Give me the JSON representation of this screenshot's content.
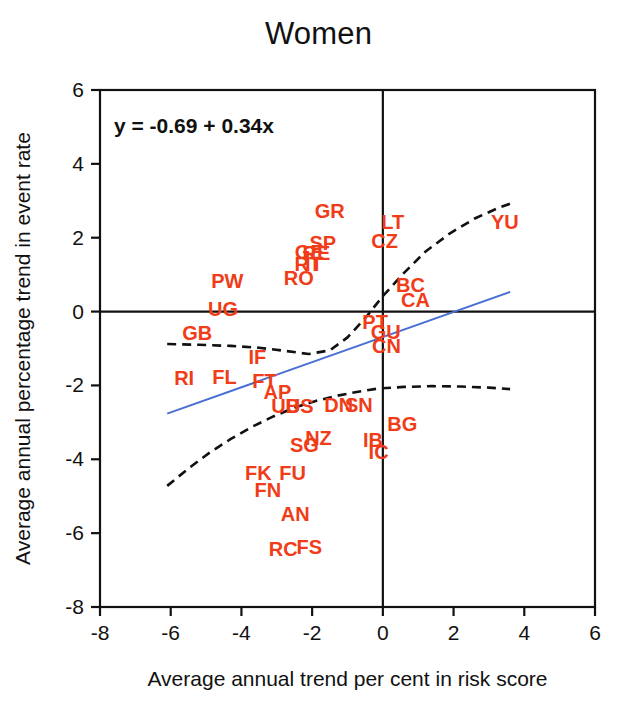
{
  "chart_data": {
    "type": "scatter",
    "title": "Women",
    "xlabel": "Average annual trend per cent in risk score",
    "ylabel": "Average annual percentage trend in event rate",
    "xlim": [
      -8,
      6
    ],
    "ylim": [
      -8,
      6
    ],
    "xticks": [
      -8,
      -6,
      -4,
      -2,
      0,
      2,
      4,
      6
    ],
    "xtick_labels": [
      "-8",
      "-6",
      "-4",
      "-2",
      "0",
      "2",
      "4",
      "6"
    ],
    "yticks": [
      -8,
      -6,
      -4,
      -2,
      0,
      2,
      4,
      6
    ],
    "ytick_labels": [
      "-8",
      "-6",
      "-4",
      "-2",
      "0",
      "2",
      "4",
      "6"
    ],
    "grid": false,
    "legend": "none",
    "annotation": "y = -0.69 + 0.34x",
    "regression": {
      "intercept": -0.69,
      "slope": 0.34,
      "color": "#4a6fd4",
      "x_start": -6.1,
      "x_end": 3.6
    },
    "reference_lines": {
      "horizontal_y": 0,
      "vertical_x": 0,
      "color": "#111111"
    },
    "confidence_band": {
      "style": "dashed",
      "color": "#111111",
      "upper": [
        [
          -6.1,
          -0.88
        ],
        [
          -5.2,
          -0.9
        ],
        [
          -4.3,
          -0.93
        ],
        [
          -3.5,
          -0.98
        ],
        [
          -2.8,
          -1.06
        ],
        [
          -2.1,
          -1.15
        ],
        [
          -1.5,
          -1.05
        ],
        [
          -1.0,
          -0.7
        ],
        [
          -0.5,
          -0.18
        ],
        [
          0.0,
          0.42
        ],
        [
          0.6,
          1.05
        ],
        [
          1.2,
          1.62
        ],
        [
          1.9,
          2.12
        ],
        [
          2.6,
          2.52
        ],
        [
          3.3,
          2.82
        ],
        [
          3.6,
          2.92
        ]
      ],
      "lower": [
        [
          -6.1,
          -4.72
        ],
        [
          -5.5,
          -4.25
        ],
        [
          -4.9,
          -3.82
        ],
        [
          -4.3,
          -3.45
        ],
        [
          -3.7,
          -3.12
        ],
        [
          -3.1,
          -2.84
        ],
        [
          -2.5,
          -2.6
        ],
        [
          -1.9,
          -2.42
        ],
        [
          -1.3,
          -2.28
        ],
        [
          -0.7,
          -2.17
        ],
        [
          -0.1,
          -2.08
        ],
        [
          0.6,
          -2.04
        ],
        [
          1.4,
          -2.02
        ],
        [
          2.2,
          -2.03
        ],
        [
          3.0,
          -2.06
        ],
        [
          3.6,
          -2.1
        ]
      ]
    },
    "point_color": "#f03c18",
    "points": [
      {
        "label": "GR",
        "x": -1.5,
        "y": 2.72
      },
      {
        "label": "LT",
        "x": 0.28,
        "y": 2.42
      },
      {
        "label": "YU",
        "x": 3.45,
        "y": 2.42
      },
      {
        "label": "SP",
        "x": -1.7,
        "y": 1.85
      },
      {
        "label": "CZ",
        "x": 0.05,
        "y": 1.92
      },
      {
        "label": "GE",
        "x": -2.08,
        "y": 1.62
      },
      {
        "label": "RE",
        "x": -1.88,
        "y": 1.58
      },
      {
        "label": "RT",
        "x": -2.12,
        "y": 1.3
      },
      {
        "label": "IT",
        "x": -1.95,
        "y": 1.28
      },
      {
        "label": "RO",
        "x": -2.38,
        "y": 0.92
      },
      {
        "label": "PW",
        "x": -4.4,
        "y": 0.82
      },
      {
        "label": "BC",
        "x": 0.78,
        "y": 0.72
      },
      {
        "label": "CA",
        "x": 0.92,
        "y": 0.32
      },
      {
        "label": "UG",
        "x": -4.52,
        "y": 0.08
      },
      {
        "label": "PT",
        "x": -0.22,
        "y": -0.28
      },
      {
        "label": "GU",
        "x": 0.08,
        "y": -0.55
      },
      {
        "label": "GB",
        "x": -5.25,
        "y": -0.58
      },
      {
        "label": "CN",
        "x": 0.1,
        "y": -0.92
      },
      {
        "label": "IF",
        "x": -3.55,
        "y": -1.22
      },
      {
        "label": "RI",
        "x": -5.62,
        "y": -1.8
      },
      {
        "label": "FL",
        "x": -4.48,
        "y": -1.78
      },
      {
        "label": "FT",
        "x": -3.35,
        "y": -1.88
      },
      {
        "label": "AP",
        "x": -2.98,
        "y": -2.18
      },
      {
        "label": "UB",
        "x": -2.75,
        "y": -2.55
      },
      {
        "label": "US",
        "x": -2.35,
        "y": -2.55
      },
      {
        "label": "DN",
        "x": -1.25,
        "y": -2.52
      },
      {
        "label": "SN",
        "x": -0.68,
        "y": -2.52
      },
      {
        "label": "BG",
        "x": 0.55,
        "y": -3.05
      },
      {
        "label": "SG",
        "x": -2.22,
        "y": -3.62
      },
      {
        "label": "NZ",
        "x": -1.82,
        "y": -3.42
      },
      {
        "label": "IB",
        "x": -0.28,
        "y": -3.48
      },
      {
        "label": "IC",
        "x": -0.12,
        "y": -3.8
      },
      {
        "label": "FK",
        "x": -3.52,
        "y": -4.38
      },
      {
        "label": "FU",
        "x": -2.55,
        "y": -4.38
      },
      {
        "label": "FN",
        "x": -3.25,
        "y": -4.82
      },
      {
        "label": "AN",
        "x": -2.48,
        "y": -5.48
      },
      {
        "label": "RC",
        "x": -2.82,
        "y": -6.42
      },
      {
        "label": "FS",
        "x": -2.08,
        "y": -6.38
      }
    ]
  }
}
